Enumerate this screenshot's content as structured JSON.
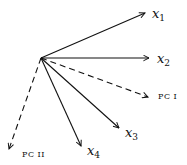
{
  "diagram": {
    "title": "",
    "origin": {
      "x": 41,
      "y": 58
    },
    "vectors": [
      {
        "id": "x1",
        "var": "x",
        "sub": "1",
        "style": "solid",
        "tip": {
          "x": 145,
          "y": 13
        },
        "label_pos": {
          "x": 152,
          "y": 18
        }
      },
      {
        "id": "x2",
        "var": "x",
        "sub": "2",
        "style": "solid",
        "tip": {
          "x": 149,
          "y": 58
        },
        "label_pos": {
          "x": 157,
          "y": 63
        }
      },
      {
        "id": "pc1",
        "label": "PC I",
        "style": "dashed",
        "tip": {
          "x": 148,
          "y": 97
        },
        "label_pos": {
          "x": 158,
          "y": 99
        }
      },
      {
        "id": "x3",
        "var": "x",
        "sub": "3",
        "style": "solid",
        "tip": {
          "x": 119,
          "y": 128
        },
        "label_pos": {
          "x": 125,
          "y": 137
        }
      },
      {
        "id": "x4",
        "var": "x",
        "sub": "4",
        "style": "solid",
        "tip": {
          "x": 81,
          "y": 146
        },
        "label_pos": {
          "x": 87,
          "y": 155
        }
      },
      {
        "id": "pc2",
        "label": "PC II",
        "style": "dashed",
        "tip": {
          "x": 9,
          "y": 149
        },
        "label_pos": {
          "x": 22,
          "y": 157
        }
      }
    ]
  },
  "labels": {
    "x1_var": "x",
    "x1_sub": "1",
    "x2_var": "x",
    "x2_sub": "2",
    "x3_var": "x",
    "x3_sub": "3",
    "x4_var": "x",
    "x4_sub": "4",
    "pc1": "PC I",
    "pc2": "PC II"
  },
  "colors": {
    "stroke": "#111111",
    "background": "#ffffff"
  }
}
